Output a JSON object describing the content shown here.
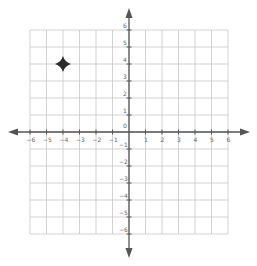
{
  "diagram": {
    "type": "coordinate-plane",
    "x_range": [
      -6,
      6
    ],
    "y_range": [
      -6,
      6
    ],
    "x_tick_labels": [
      "-6",
      "-5",
      "-4",
      "-3",
      "-2",
      "-1",
      "1",
      "2",
      "3",
      "4",
      "5",
      "6"
    ],
    "y_tick_labels": [
      "6",
      "5",
      "4",
      "3",
      "2",
      "1",
      "0",
      "-1",
      "-2",
      "-3",
      "-4",
      "-5",
      "-6"
    ],
    "origin_label": "0",
    "grid": true,
    "colors": {
      "grid": "#c8c8c8",
      "axis": "#555555",
      "marker": "#2a2a2a",
      "label": "#666666"
    },
    "points": [
      {
        "name": "star-marker",
        "x": -4,
        "y": 4,
        "shape": "four-point-star"
      }
    ]
  }
}
